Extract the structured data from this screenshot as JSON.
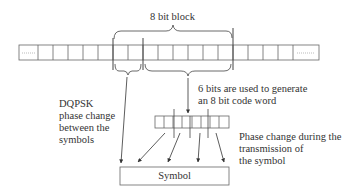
{
  "diagram": {
    "block_label": "8 bit block",
    "six_bits_label_line1": "6 bits are used to generate",
    "six_bits_label_line2": "an 8 bit code word",
    "dqpsk_label_line1": "DQPSK",
    "dqpsk_label_line2": "phase change",
    "dqpsk_label_line3": "between the",
    "dqpsk_label_line4": "symbols",
    "phase_label_line1": "Phase change during the",
    "phase_label_line2": "transmission of",
    "phase_label_line3": "the symbol",
    "symbol_label": "Symbol",
    "bit_row": {
      "cell_count_visible": 18,
      "leading_ellipsis": true,
      "trailing_ellipsis": true
    },
    "code_word_cells": 8,
    "colors": {
      "line": "#555555",
      "text": "#333333",
      "ellipsis": "#aaaaaa"
    }
  }
}
